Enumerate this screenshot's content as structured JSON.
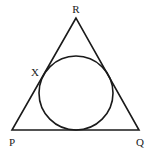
{
  "diagram": {
    "type": "triangle-with-incircle",
    "labels": {
      "R": "R",
      "X": "X",
      "P": "P",
      "Q": "Q"
    },
    "stroke_color": "#1a1a1a",
    "background": "#ffffff"
  }
}
